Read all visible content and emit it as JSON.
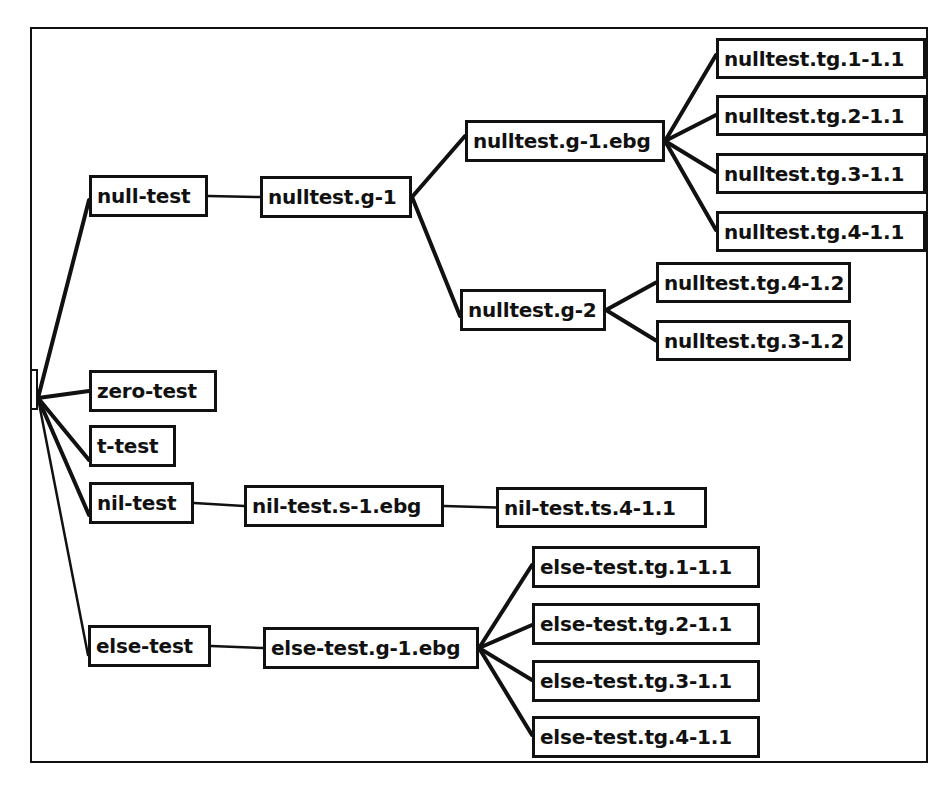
{
  "diagram": {
    "type": "tree",
    "root": {
      "id": "root",
      "label": "",
      "x": 30,
      "y": 369,
      "w": 8,
      "h": 41
    },
    "nodes": [
      {
        "id": "null-test",
        "label": "null-test",
        "x": 89,
        "y": 175,
        "w": 119,
        "h": 42
      },
      {
        "id": "nulltest.g-1",
        "label": "nulltest.g-1",
        "x": 260,
        "y": 176,
        "w": 152,
        "h": 42
      },
      {
        "id": "nulltest.g-1.ebg",
        "label": "nulltest.g-1.ebg",
        "x": 465,
        "y": 120,
        "w": 200,
        "h": 42
      },
      {
        "id": "nulltest.tg.1-1.1",
        "label": "nulltest.tg.1-1.1",
        "x": 716,
        "y": 38,
        "w": 210,
        "h": 41
      },
      {
        "id": "nulltest.tg.2-1.1",
        "label": "nulltest.tg.2-1.1",
        "x": 716,
        "y": 95,
        "w": 210,
        "h": 41
      },
      {
        "id": "nulltest.tg.3-1.1",
        "label": "nulltest.tg.3-1.1",
        "x": 716,
        "y": 153,
        "w": 210,
        "h": 41
      },
      {
        "id": "nulltest.tg.4-1.1",
        "label": "nulltest.tg.4-1.1",
        "x": 716,
        "y": 211,
        "w": 210,
        "h": 41
      },
      {
        "id": "nulltest.g-2",
        "label": "nulltest.g-2",
        "x": 460,
        "y": 289,
        "w": 146,
        "h": 42
      },
      {
        "id": "nulltest.tg.4-1.2",
        "label": "nulltest.tg.4-1.2",
        "x": 656,
        "y": 262,
        "w": 195,
        "h": 41
      },
      {
        "id": "nulltest.tg.3-1.2",
        "label": "nulltest.tg.3-1.2",
        "x": 656,
        "y": 320,
        "w": 195,
        "h": 41
      },
      {
        "id": "zero-test",
        "label": "zero-test",
        "x": 89,
        "y": 370,
        "w": 128,
        "h": 42
      },
      {
        "id": "t-test",
        "label": "t-test",
        "x": 89,
        "y": 425,
        "w": 87,
        "h": 42
      },
      {
        "id": "nil-test",
        "label": "nil-test",
        "x": 89,
        "y": 482,
        "w": 105,
        "h": 42
      },
      {
        "id": "nil-test.s-1.ebg",
        "label": "nil-test.s-1.ebg",
        "x": 244,
        "y": 485,
        "w": 200,
        "h": 42
      },
      {
        "id": "nil-test.ts.4-1.1",
        "label": "nil-test.ts.4-1.1",
        "x": 496,
        "y": 487,
        "w": 211,
        "h": 41
      },
      {
        "id": "else-test",
        "label": "else-test",
        "x": 88,
        "y": 625,
        "w": 123,
        "h": 42
      },
      {
        "id": "else-test.g-1.ebg",
        "label": "else-test.g-1.ebg",
        "x": 263,
        "y": 627,
        "w": 216,
        "h": 42
      },
      {
        "id": "else-test.tg.1-1.1",
        "label": "else-test.tg.1-1.1",
        "x": 532,
        "y": 546,
        "w": 228,
        "h": 42
      },
      {
        "id": "else-test.tg.2-1.1",
        "label": "else-test.tg.2-1.1",
        "x": 532,
        "y": 603,
        "w": 228,
        "h": 42
      },
      {
        "id": "else-test.tg.3-1.1",
        "label": "else-test.tg.3-1.1",
        "x": 532,
        "y": 660,
        "w": 228,
        "h": 42
      },
      {
        "id": "else-test.tg.4-1.1",
        "label": "else-test.tg.4-1.1",
        "x": 532,
        "y": 716,
        "w": 228,
        "h": 42
      }
    ],
    "edges": [
      {
        "from": "root",
        "to": "null-test",
        "thick": true,
        "from_y": 398,
        "to_y": 200
      },
      {
        "from": "root",
        "to": "zero-test",
        "thick": true,
        "from_y": 398
      },
      {
        "from": "root",
        "to": "t-test",
        "thick": true,
        "from_y": 398,
        "to_y": 460
      },
      {
        "from": "root",
        "to": "nil-test",
        "thick": true,
        "from_y": 398,
        "to_y": 515
      },
      {
        "from": "root",
        "to": "else-test",
        "thick": false,
        "from_y": 398,
        "to_y": 655
      },
      {
        "from": "null-test",
        "to": "nulltest.g-1",
        "thick": false
      },
      {
        "from": "nulltest.g-1",
        "to": "nulltest.g-1.ebg",
        "thick": true,
        "to_y": 136
      },
      {
        "from": "nulltest.g-1",
        "to": "nulltest.g-2",
        "thick": true,
        "to_y": 316
      },
      {
        "from": "nulltest.g-1.ebg",
        "to": "nulltest.tg.1-1.1",
        "thick": true,
        "to_y": 55
      },
      {
        "from": "nulltest.g-1.ebg",
        "to": "nulltest.tg.2-1.1",
        "thick": true,
        "to_y": 115
      },
      {
        "from": "nulltest.g-1.ebg",
        "to": "nulltest.tg.3-1.1",
        "thick": true,
        "to_y": 172
      },
      {
        "from": "nulltest.g-1.ebg",
        "to": "nulltest.tg.4-1.1",
        "thick": true,
        "to_y": 230
      },
      {
        "from": "nulltest.g-2",
        "to": "nulltest.tg.4-1.2",
        "thick": true
      },
      {
        "from": "nulltest.g-2",
        "to": "nulltest.tg.3-1.2",
        "thick": true
      },
      {
        "from": "nil-test",
        "to": "nil-test.s-1.ebg",
        "thick": false
      },
      {
        "from": "nil-test.s-1.ebg",
        "to": "nil-test.ts.4-1.1",
        "thick": false
      },
      {
        "from": "else-test",
        "to": "else-test.g-1.ebg",
        "thick": false
      },
      {
        "from": "else-test.g-1.ebg",
        "to": "else-test.tg.1-1.1",
        "thick": true,
        "to_y": 565
      },
      {
        "from": "else-test.g-1.ebg",
        "to": "else-test.tg.2-1.1",
        "thick": true,
        "to_y": 625
      },
      {
        "from": "else-test.g-1.ebg",
        "to": "else-test.tg.3-1.1",
        "thick": true,
        "to_y": 680
      },
      {
        "from": "else-test.g-1.ebg",
        "to": "else-test.tg.4-1.1",
        "thick": true,
        "to_y": 735
      }
    ],
    "colors": {
      "line": "#111111",
      "background": "#ffffff"
    }
  }
}
